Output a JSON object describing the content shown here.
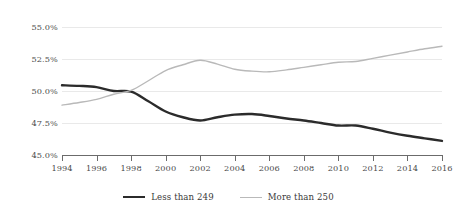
{
  "chart_data": {
    "type": "line",
    "title": "",
    "subtitle": "",
    "xlabel": "",
    "ylabel": "",
    "xlim": [
      1994,
      2016
    ],
    "ylim": [
      45.0,
      55.0
    ],
    "grid": true,
    "legend_position": "bottom-center",
    "y_ticks": [
      55.0,
      52.5,
      50.0,
      47.5,
      45.0
    ],
    "y_tick_labels": [
      "55.0%",
      "52.5%",
      "50.0%",
      "47.5%",
      "45.0%"
    ],
    "x_ticks": [
      1994,
      1996,
      1998,
      2000,
      2002,
      2004,
      2006,
      2008,
      2010,
      2012,
      2014,
      2016
    ],
    "x_tick_labels": [
      "1994",
      "1996",
      "1998",
      "2000",
      "2002",
      "2004",
      "2006",
      "2008",
      "2010",
      "2012",
      "2014",
      "2016"
    ],
    "x": [
      1994,
      1995,
      1996,
      1997,
      1998,
      1999,
      2000,
      2001,
      2002,
      2003,
      2004,
      2005,
      2006,
      2007,
      2008,
      2009,
      2010,
      2011,
      2012,
      2013,
      2014,
      2015,
      2016
    ],
    "series": [
      {
        "name": "Less than 249",
        "color": "#2b2b2b",
        "width": 2.4,
        "values": [
          50.45,
          50.4,
          50.3,
          50.0,
          49.95,
          49.2,
          48.4,
          47.95,
          47.7,
          47.95,
          48.15,
          48.2,
          48.05,
          47.85,
          47.7,
          47.5,
          47.3,
          47.3,
          47.05,
          46.75,
          46.5,
          46.3,
          46.1
        ]
      },
      {
        "name": "More than 250",
        "color": "#b9b9b9",
        "width": 1.4,
        "values": [
          48.9,
          49.1,
          49.35,
          49.75,
          50.05,
          50.8,
          51.6,
          52.05,
          52.4,
          52.1,
          51.7,
          51.55,
          51.5,
          51.65,
          51.85,
          52.05,
          52.25,
          52.3,
          52.55,
          52.8,
          53.05,
          53.3,
          53.5
        ]
      }
    ]
  },
  "legend": {
    "items": [
      {
        "label": "Less than 249"
      },
      {
        "label": "More than 250"
      }
    ]
  }
}
